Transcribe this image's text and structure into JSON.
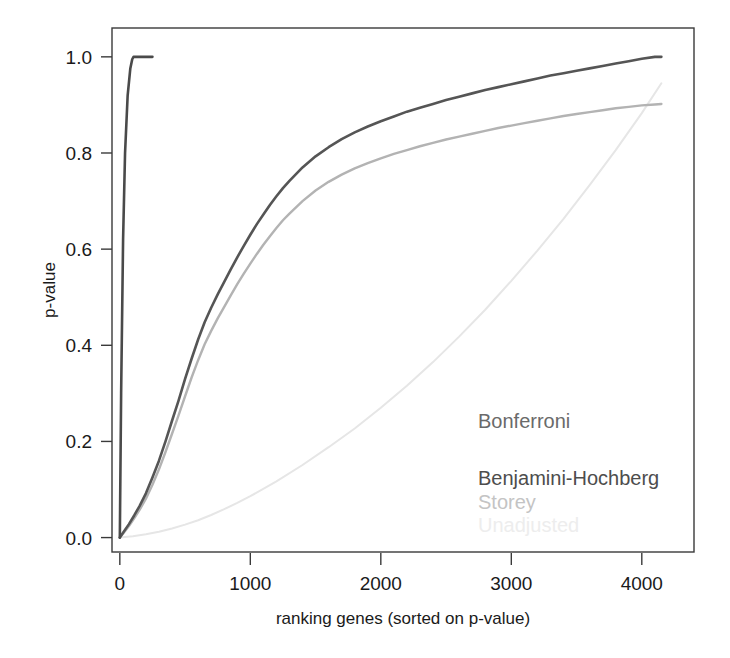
{
  "chart_data": {
    "type": "line",
    "title": "",
    "xlabel": "ranking genes (sorted on p-value)",
    "ylabel": "p-value",
    "xlim": [
      -60,
      4400
    ],
    "ylim": [
      -0.03,
      1.06
    ],
    "xticks": [
      0,
      1000,
      2000,
      3000,
      4000
    ],
    "xtick_labels": [
      "0",
      "1000",
      "2000",
      "3000",
      "4000"
    ],
    "yticks": [
      0.0,
      0.2,
      0.4,
      0.6,
      0.8,
      1.0
    ],
    "ytick_labels": [
      "0.0",
      "0.2",
      "0.4",
      "0.6",
      "0.8",
      "1.0"
    ],
    "grid": false,
    "legend_position": "lower-right",
    "series": [
      {
        "name": "Bonferroni",
        "color": "#4a4a4a",
        "linewidth": 2.6,
        "x": [
          0,
          10,
          25,
          40,
          60,
          80,
          95,
          105,
          115,
          130,
          170,
          250
        ],
        "y": [
          0.0,
          0.3,
          0.62,
          0.8,
          0.92,
          0.975,
          0.995,
          1.0,
          1.0,
          1.0,
          1.0,
          1.0
        ]
      },
      {
        "name": "Benjamini-Hochberg",
        "color": "#555555",
        "linewidth": 2.6,
        "x": [
          0,
          30,
          70,
          110,
          150,
          200,
          250,
          300,
          350,
          400,
          450,
          500,
          550,
          600,
          650,
          700,
          750,
          800,
          850,
          900,
          950,
          1000,
          1050,
          1100,
          1150,
          1200,
          1250,
          1300,
          1400,
          1500,
          1600,
          1700,
          1800,
          1900,
          2000,
          2100,
          2200,
          2300,
          2400,
          2500,
          2600,
          2700,
          2800,
          2900,
          3000,
          3100,
          3200,
          3300,
          3400,
          3500,
          3600,
          3700,
          3800,
          3900,
          4000,
          4100,
          4150
        ],
        "y": [
          0.0,
          0.012,
          0.028,
          0.046,
          0.065,
          0.092,
          0.125,
          0.16,
          0.2,
          0.243,
          0.285,
          0.33,
          0.372,
          0.412,
          0.448,
          0.478,
          0.506,
          0.532,
          0.558,
          0.583,
          0.607,
          0.63,
          0.652,
          0.672,
          0.692,
          0.71,
          0.727,
          0.742,
          0.77,
          0.793,
          0.812,
          0.829,
          0.843,
          0.855,
          0.866,
          0.876,
          0.886,
          0.894,
          0.902,
          0.91,
          0.917,
          0.924,
          0.931,
          0.937,
          0.943,
          0.949,
          0.955,
          0.961,
          0.966,
          0.971,
          0.976,
          0.981,
          0.986,
          0.991,
          0.996,
          1.0,
          1.0
        ]
      },
      {
        "name": "Storey",
        "color": "#b3b3b3",
        "linewidth": 2.4,
        "x": [
          0,
          30,
          70,
          110,
          150,
          200,
          250,
          300,
          350,
          400,
          450,
          500,
          550,
          600,
          650,
          700,
          750,
          800,
          850,
          900,
          950,
          1000,
          1050,
          1100,
          1150,
          1200,
          1250,
          1300,
          1400,
          1500,
          1600,
          1700,
          1800,
          1900,
          2000,
          2100,
          2200,
          2300,
          2400,
          2500,
          2600,
          2700,
          2800,
          2900,
          3000,
          3100,
          3200,
          3300,
          3400,
          3500,
          3600,
          3700,
          3800,
          3900,
          4000,
          4100,
          4150
        ],
        "y": [
          0.0,
          0.01,
          0.024,
          0.04,
          0.057,
          0.081,
          0.11,
          0.142,
          0.178,
          0.216,
          0.254,
          0.294,
          0.333,
          0.369,
          0.402,
          0.43,
          0.456,
          0.48,
          0.504,
          0.527,
          0.549,
          0.57,
          0.59,
          0.609,
          0.627,
          0.644,
          0.66,
          0.674,
          0.7,
          0.722,
          0.74,
          0.755,
          0.768,
          0.779,
          0.789,
          0.798,
          0.806,
          0.814,
          0.821,
          0.828,
          0.834,
          0.84,
          0.846,
          0.852,
          0.857,
          0.862,
          0.867,
          0.872,
          0.877,
          0.881,
          0.885,
          0.889,
          0.893,
          0.896,
          0.899,
          0.901,
          0.902
        ]
      },
      {
        "name": "Unadjusted",
        "color": "#e6e6e6",
        "linewidth": 2.0,
        "x": [
          0,
          100,
          200,
          300,
          400,
          500,
          600,
          700,
          800,
          900,
          1000,
          1200,
          1400,
          1600,
          1800,
          2000,
          2200,
          2400,
          2600,
          2800,
          3000,
          3200,
          3400,
          3600,
          3800,
          4000,
          4150
        ],
        "y": [
          0.0,
          0.003,
          0.007,
          0.012,
          0.019,
          0.027,
          0.036,
          0.047,
          0.059,
          0.072,
          0.086,
          0.117,
          0.151,
          0.188,
          0.227,
          0.27,
          0.316,
          0.365,
          0.418,
          0.474,
          0.534,
          0.597,
          0.663,
          0.733,
          0.806,
          0.883,
          0.945
        ]
      }
    ]
  },
  "legend": {
    "entries": [
      {
        "label": "Bonferroni",
        "color": "#6a6a6a"
      },
      {
        "label": "Benjamini-Hochberg",
        "color": "#4d4d4d"
      },
      {
        "label": "Storey",
        "color": "#c4c4c4"
      },
      {
        "label": "Unadjusted",
        "color": "#ededed"
      }
    ]
  }
}
